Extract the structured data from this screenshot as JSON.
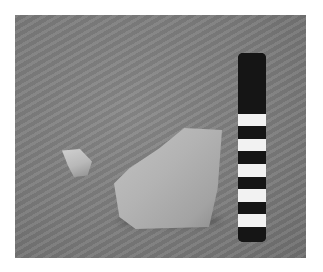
{
  "image": {
    "description": "Photograph of two stone/ceramic fragments on a grey textured surface beside a black-and-white striped scale bar",
    "background_color": "#ffffff",
    "surface_color": "#7c7c7c",
    "objects": [
      {
        "name": "small-fragment",
        "color": "#c0c0c0"
      },
      {
        "name": "large-fragment",
        "color": "#b3b3b3"
      },
      {
        "name": "scale-bar",
        "colors": [
          "#151515",
          "#f2f2f2"
        ],
        "white_bands": 5,
        "black_bands": 5
      }
    ]
  },
  "scale_bar": {
    "bands": [
      {
        "color": "#151515",
        "top": 0,
        "height": 61
      },
      {
        "color": "#f2f2f2",
        "top": 61,
        "height": 12
      },
      {
        "color": "#151515",
        "top": 73,
        "height": 13
      },
      {
        "color": "#f2f2f2",
        "top": 86,
        "height": 12
      },
      {
        "color": "#151515",
        "top": 98,
        "height": 13
      },
      {
        "color": "#f2f2f2",
        "top": 111,
        "height": 13
      },
      {
        "color": "#151515",
        "top": 124,
        "height": 12
      },
      {
        "color": "#f2f2f2",
        "top": 136,
        "height": 13
      },
      {
        "color": "#151515",
        "top": 149,
        "height": 12
      },
      {
        "color": "#f2f2f2",
        "top": 161,
        "height": 13
      },
      {
        "color": "#151515",
        "top": 174,
        "height": 15
      }
    ]
  }
}
